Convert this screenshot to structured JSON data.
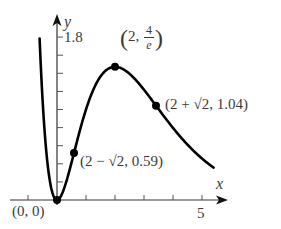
{
  "chart_data": {
    "type": "line",
    "title": "",
    "function": "f(x) = x^2 e^(1-x)",
    "xlabel": "x",
    "ylabel": "y",
    "xlim": [
      -0.6,
      5.6
    ],
    "ylim": [
      -0.05,
      1.9
    ],
    "x_ticks": [
      -1,
      1,
      2,
      3,
      4,
      5
    ],
    "x_tick_labels": [
      {
        "value": 5,
        "label": "5"
      }
    ],
    "y_ticks": [
      0.2,
      0.4,
      0.6,
      0.8,
      1.0,
      1.2,
      1.4,
      1.6,
      1.8
    ],
    "y_tick_labels": [
      {
        "value": 1.8,
        "label": "1.8"
      }
    ],
    "grid": false,
    "legend": null,
    "series": [
      {
        "name": "curve",
        "x_range": [
          -0.6,
          5.4
        ],
        "color": "#000000"
      }
    ],
    "points": [
      {
        "x": 0,
        "y": 0,
        "label": "(0, 0)"
      },
      {
        "x": 0.586,
        "y": 0.59,
        "label": "(2 − √2, 0.59)"
      },
      {
        "x": 2,
        "y": 1.4715,
        "label": "(2, 4/e)"
      },
      {
        "x": 3.414,
        "y": 1.04,
        "label": "(2 + √2, 1.04)"
      }
    ]
  },
  "labels": {
    "y_axis": "y",
    "x_axis": "x",
    "y_tick_top": "1.8",
    "x_tick_5": "5",
    "origin": "(0, 0)",
    "max_point_prefix": "2,",
    "max_point_num": "4",
    "max_point_den": "e",
    "inflection_right": "(2 + √2, 1.04)",
    "inflection_left": "(2 − √2, 0.59)"
  }
}
